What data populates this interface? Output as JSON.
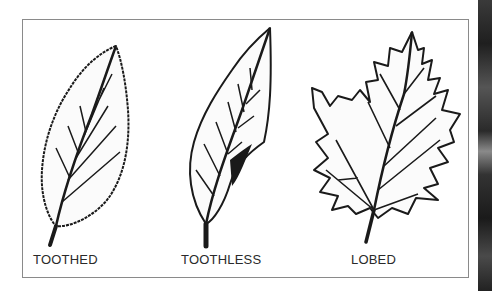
{
  "figure": {
    "leaves": [
      {
        "label": "TOOTHED",
        "type": "toothed"
      },
      {
        "label": "TOOTHLESS",
        "type": "toothless"
      },
      {
        "label": "LOBED",
        "type": "lobed"
      }
    ]
  },
  "colors": {
    "ink": "#1a1a1a",
    "frame_border": "#8a8a8a",
    "background": "#ffffff"
  }
}
